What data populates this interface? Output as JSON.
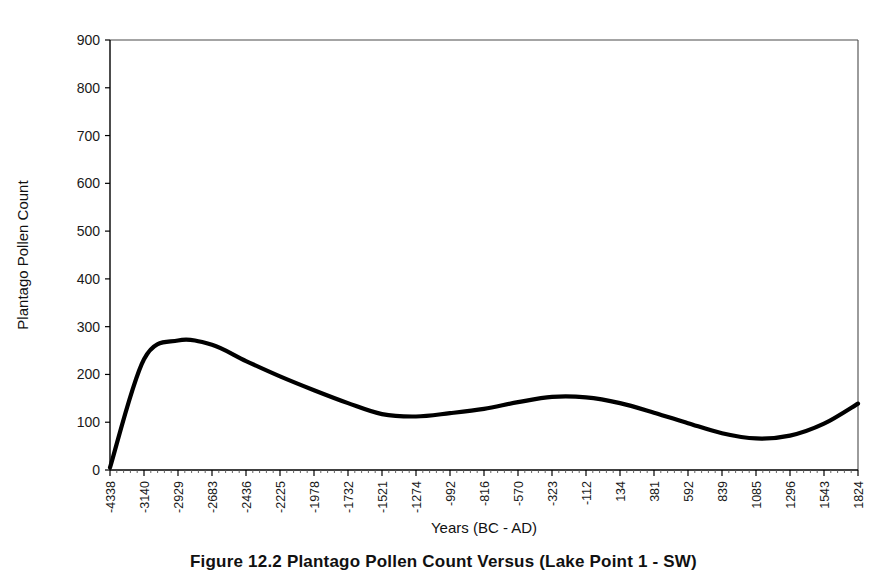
{
  "figure": {
    "caption": "Figure 12.2  Plantago Pollen Count Versus (Lake Point 1 - SW)"
  },
  "chart_data": {
    "type": "line",
    "title": "",
    "xlabel": "Years (BC - AD)",
    "ylabel": "Plantago Pollen Count",
    "grid": false,
    "legend": "none",
    "ylim": [
      0,
      900
    ],
    "yticks": [
      0,
      100,
      200,
      300,
      400,
      500,
      600,
      700,
      800,
      900
    ],
    "ytick_labels": [
      "0",
      "100",
      "200",
      "300",
      "400",
      "500",
      "600",
      "700",
      "800",
      "900"
    ],
    "categories": [
      "-4338",
      "-3140",
      "-2929",
      "-2683",
      "-2436",
      "-2225",
      "-1978",
      "-1732",
      "-1521",
      "-1274",
      "-992",
      "-816",
      "-570",
      "-323",
      "-112",
      "134",
      "381",
      "592",
      "839",
      "1085",
      "1296",
      "1543",
      "1824"
    ],
    "series": [
      {
        "name": "Plantago Pollen Count",
        "color": "#000000",
        "values": [
          5,
          232,
          271,
          262,
          228,
          196,
          167,
          140,
          117,
          112,
          119,
          128,
          142,
          153,
          152,
          140,
          120,
          98,
          77,
          66,
          72,
          97,
          139
        ]
      }
    ]
  }
}
